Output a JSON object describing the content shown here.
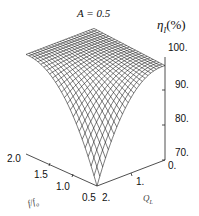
{
  "chart_data": {
    "type": "surface3d",
    "title": "A = 0.5",
    "zlabel": "η_I(%)",
    "xlabel": "f/f_o",
    "ylabel": "Q_L",
    "x_ticks": [
      "0.5",
      "1.0",
      "1.5",
      "2.0"
    ],
    "y_ticks": [
      "0.",
      "1.",
      "2."
    ],
    "z_ticks": [
      "70.",
      "80.",
      "90.",
      "100."
    ],
    "xlim": [
      0.5,
      2.0
    ],
    "ylim": [
      0,
      2
    ],
    "zlim": [
      70,
      100
    ],
    "grid": "wireframe mesh",
    "samples": [
      {
        "f_over_fo": 2.0,
        "QL": 0,
        "eta": 99
      },
      {
        "f_over_fo": 2.0,
        "QL": 2,
        "eta": 97
      },
      {
        "f_over_fo": 0.5,
        "QL": 0,
        "eta": 98
      },
      {
        "f_over_fo": 1.0,
        "QL": 1,
        "eta": 96
      },
      {
        "f_over_fo": 0.5,
        "QL": 2,
        "eta": 70
      }
    ]
  },
  "labels": {
    "title": "A = 0.5",
    "zlabel_eta": "η",
    "zlabel_sub": "I",
    "zlabel_pct": "(%)",
    "xlabel": "f/f",
    "xlabel_sub": "o",
    "ylabel": "Q",
    "ylabel_sub": "L"
  }
}
